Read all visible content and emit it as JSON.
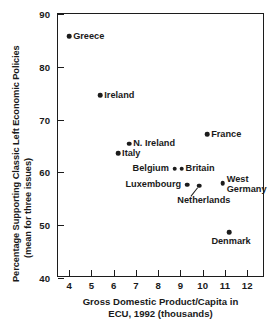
{
  "chart_data": {
    "type": "scatter",
    "title": "",
    "xlabel": "Gross Domestic Product/Capita in ECU, 1992 (thousands)",
    "xlabel_line1": "Gross Domestic Product/Capita in",
    "xlabel_line2": "ECU, 1992 (thousands)",
    "ylabel": "Percentage Supporting Classic Left Economic Policies (mean for three issues)",
    "ylabel_line1": "Percentage Supporting Classic Left Economic Policies",
    "ylabel_line2": "(mean for three issues)",
    "xlim": [
      3.5,
      12.8
    ],
    "ylim": [
      40,
      90
    ],
    "xticks": [
      4,
      5,
      6,
      7,
      8,
      9,
      10,
      11,
      12
    ],
    "yticks": [
      40,
      50,
      60,
      70,
      80,
      90
    ],
    "grid": false,
    "legend": "none",
    "marker_color": "#1c1c1c",
    "axis_color": "#1c1c1c",
    "points": [
      {
        "label": "Greece",
        "x": 4.0,
        "y": 85.8,
        "label_pos": "right"
      },
      {
        "label": "Ireland",
        "x": 5.4,
        "y": 74.6,
        "label_pos": "right"
      },
      {
        "label": "N. Ireland",
        "x": 6.7,
        "y": 65.4,
        "label_pos": "right"
      },
      {
        "label": "Italy",
        "x": 6.2,
        "y": 63.6,
        "label_pos": "right"
      },
      {
        "label": "Belgium",
        "x": 8.75,
        "y": 60.7,
        "label_pos": "left"
      },
      {
        "label": "Britain",
        "x": 9.05,
        "y": 60.7,
        "label_pos": "right"
      },
      {
        "label": "Luxembourg",
        "x": 9.3,
        "y": 57.7,
        "label_pos": "left"
      },
      {
        "label": "Netherlands",
        "x": 9.85,
        "y": 57.5,
        "label_pos": "below"
      },
      {
        "label": "France",
        "x": 10.2,
        "y": 67.2,
        "label_pos": "right"
      },
      {
        "label": "West Germany",
        "x": 10.9,
        "y": 58.0,
        "label_pos": "right-two-line",
        "label_line1": "West",
        "label_line2": "Germany"
      },
      {
        "label": "Denmark",
        "x": 11.2,
        "y": 48.7,
        "label_pos": "below"
      }
    ]
  }
}
